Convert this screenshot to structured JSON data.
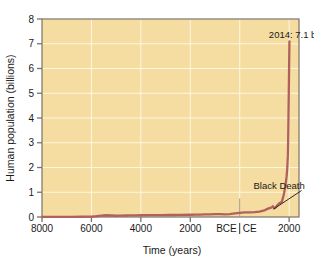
{
  "figure": {
    "name": "human-population-growth-chart",
    "background_color": "#ffffff",
    "plot_background_color": "#f5dca0",
    "line_color": "#b0615e",
    "gridline_color": "#fdf6e0",
    "axis_color": "#7a7468"
  },
  "chart_data": {
    "type": "line",
    "title": "",
    "xlabel": "Time (years)",
    "ylabel": "Human population (billions)",
    "xlim": [
      -8000,
      2400
    ],
    "ylim": [
      0,
      8
    ],
    "grid": true,
    "legend": "none",
    "x_tick_values": [
      -8000,
      -6000,
      -4000,
      -2000,
      0,
      2000
    ],
    "x_tick_labels": [
      "8000",
      "6000",
      "4000",
      "2000",
      "BCE|CE",
      "2000"
    ],
    "x_era_labels": {
      "before": "BCE",
      "after": "CE"
    },
    "y_tick_values": [
      0,
      1,
      2,
      3,
      4,
      5,
      6,
      7,
      8
    ],
    "y_tick_labels": [
      "0",
      "1",
      "2",
      "3",
      "4",
      "5",
      "6",
      "7",
      "8"
    ],
    "series": [
      {
        "name": "Human population",
        "color": "#b0615e",
        "x": [
          -8000,
          -7600,
          -7200,
          -6800,
          -6400,
          -6000,
          -5800,
          -5600,
          -5400,
          -5200,
          -5000,
          -4800,
          -4600,
          -4400,
          -4200,
          -4000,
          -3600,
          -3200,
          -2800,
          -2400,
          -2000,
          -1800,
          -1600,
          -1400,
          -1200,
          -1000,
          -800,
          -600,
          -400,
          -200,
          0,
          200,
          400,
          600,
          800,
          1000,
          1100,
          1200,
          1300,
          1340,
          1400,
          1450,
          1500,
          1600,
          1700,
          1750,
          1800,
          1850,
          1900,
          1927,
          1950,
          1960,
          1974,
          1987,
          1999,
          2011,
          2014
        ],
        "y": [
          0.005,
          0.006,
          0.007,
          0.008,
          0.01,
          0.012,
          0.03,
          0.055,
          0.07,
          0.06,
          0.05,
          0.055,
          0.06,
          0.062,
          0.064,
          0.07,
          0.072,
          0.075,
          0.08,
          0.085,
          0.09,
          0.095,
          0.1,
          0.105,
          0.11,
          0.115,
          0.115,
          0.11,
          0.12,
          0.15,
          0.17,
          0.19,
          0.19,
          0.2,
          0.22,
          0.265,
          0.32,
          0.36,
          0.39,
          0.44,
          0.35,
          0.38,
          0.45,
          0.55,
          0.6,
          0.77,
          0.98,
          1.26,
          1.65,
          2.0,
          2.5,
          3.0,
          4.0,
          5.0,
          6.0,
          7.0,
          7.1
        ]
      }
    ],
    "annotations": [
      {
        "name": "population-2014-label",
        "text": "2014: 7.1 billion",
        "x": 1180,
        "y": 7.25
      },
      {
        "name": "black-death-label",
        "text": "Black Death",
        "x": 560,
        "y": 1.15,
        "pointer_to_x": 1370,
        "pointer_to_y": 0.32
      }
    ]
  }
}
